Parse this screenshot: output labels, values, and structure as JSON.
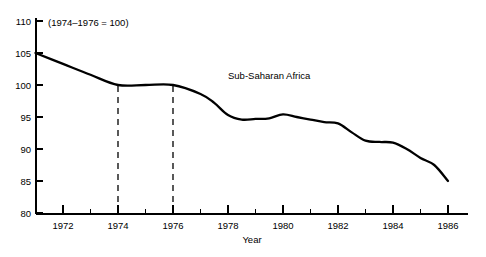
{
  "chart_data": {
    "type": "line",
    "title": "",
    "subtitle": "",
    "note": "(1974–1976 = 100)",
    "xlabel": "Year",
    "ylabel": "",
    "xlim": [
      1971,
      1986
    ],
    "ylim": [
      80,
      110
    ],
    "grid": false,
    "legend_position": "inline-annotation",
    "x_ticks_major": [
      1972,
      1974,
      1976,
      1978,
      1980,
      1982,
      1984,
      1986
    ],
    "x_ticks_minor": [
      1971,
      1973,
      1975,
      1977,
      1979,
      1981,
      1983,
      1985
    ],
    "x_tick_labels": [
      "1972",
      "1974",
      "1976",
      "1978",
      "1980",
      "1982",
      "1984",
      "1986"
    ],
    "y_ticks": [
      80,
      85,
      90,
      95,
      100,
      105,
      110
    ],
    "y_tick_labels": [
      "80",
      "85",
      "90",
      "95",
      "100",
      "105",
      "110"
    ],
    "reference_lines": [
      {
        "x": 1974,
        "style": "dashed",
        "from_y": 80,
        "to_y": 100
      },
      {
        "x": 1976,
        "style": "dashed",
        "from_y": 80,
        "to_y": 100
      }
    ],
    "series": [
      {
        "name": "Sub-Saharan Africa",
        "label_x": 1978.0,
        "label_y": 101.0,
        "color": "#000000",
        "x": [
          1971,
          1972,
          1973,
          1974,
          1975,
          1976,
          1977,
          1977.5,
          1978,
          1978.5,
          1979,
          1979.5,
          1980,
          1980.5,
          1981,
          1981.5,
          1982,
          1982.5,
          1983,
          1983.5,
          1984,
          1984.5,
          1985,
          1985.5,
          1986
        ],
        "values": [
          105.0,
          103.3,
          101.6,
          100.0,
          100.0,
          100.0,
          98.6,
          97.2,
          95.3,
          94.6,
          94.7,
          94.8,
          95.4,
          95.0,
          94.6,
          94.2,
          94.0,
          92.6,
          91.3,
          91.1,
          91.0,
          90.0,
          88.6,
          87.5,
          85.0
        ]
      }
    ]
  },
  "axis": {
    "x_axis_name": "year-axis",
    "y_axis_name": "index-axis"
  }
}
